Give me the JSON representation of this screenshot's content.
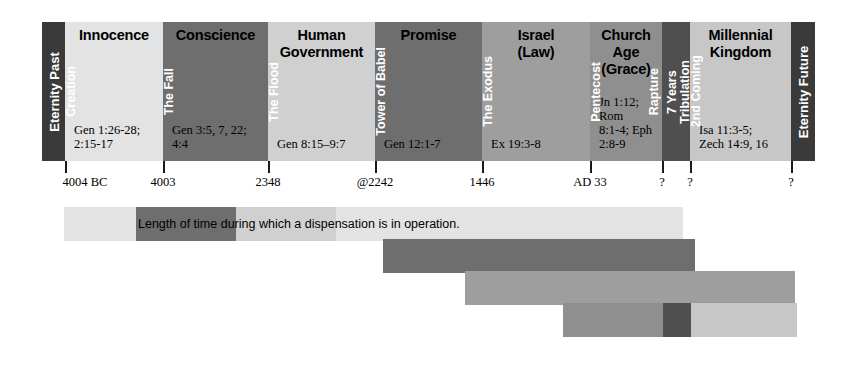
{
  "colors": {
    "eternity": "#3a3a3a",
    "very_light": "#e3e3e3",
    "light": "#d0d0d0",
    "mid_light": "#bdbdbd",
    "mid": "#9e9e9e",
    "dark": "#6e6e6e",
    "darker": "#4f4f4f",
    "tick": "#1a1a1a",
    "divider_text": "#ffffff",
    "body_text": "#000000"
  },
  "end_caps": [
    {
      "name": "eternity-past",
      "label": "Eternity Past",
      "x": 0,
      "w": 23,
      "color": "#3a3a3a"
    },
    {
      "name": "eternity-future",
      "label": "Eternity Future",
      "x": 749,
      "w": 24,
      "color": "#3a3a3a"
    }
  ],
  "dispensations": [
    {
      "name": "innocence",
      "title": "Innocence",
      "reference": "Gen 1:26-28;\n2:15-17",
      "ref_lines": [
        "Gen 1:26-28;",
        "2:15-17"
      ],
      "x": 23,
      "w": 98,
      "color": "#e3e3e3",
      "title_align": "center",
      "ref_align": "left"
    },
    {
      "name": "conscience",
      "title": "Conscience",
      "ref_lines": [
        "Gen 3:5, 7, 22;",
        "4:4"
      ],
      "x": 121,
      "w": 105,
      "color": "#6e6e6e",
      "title_align": "center",
      "ref_align": "left"
    },
    {
      "name": "human-government",
      "title": "Human\nGovernment",
      "title_lines": [
        "Human",
        "Government"
      ],
      "ref_lines": [
        "Gen 8:15–9:7"
      ],
      "x": 226,
      "w": 107,
      "color": "#d0d0d0",
      "title_align": "center",
      "ref_align": "left"
    },
    {
      "name": "promise",
      "title": "Promise",
      "ref_lines": [
        "Gen 12:1-7"
      ],
      "x": 333,
      "w": 107,
      "color": "#6e6e6e",
      "title_align": "center",
      "ref_align": "left"
    },
    {
      "name": "israel-law",
      "title": "Israel\n(Law)",
      "title_lines": [
        "Israel",
        "(Law)"
      ],
      "ref_lines": [
        "Ex 19:3-8"
      ],
      "x": 440,
      "w": 108,
      "color": "#9e9e9e",
      "title_align": "center",
      "ref_align": "left"
    },
    {
      "name": "church-age-grace",
      "title": "Church Age\n(Grace)",
      "title_lines": [
        "Church Age",
        "(Grace)"
      ],
      "ref_lines": [
        "Jn 1:12; Rom",
        "8:1-4; Eph 2:8-9"
      ],
      "x": 548,
      "w": 72,
      "color": "#8f8f8f",
      "title_align": "center",
      "ref_align": "left"
    },
    {
      "name": "tribulation",
      "title": "",
      "ref_lines": [],
      "x": 620,
      "w": 28,
      "color": "#4f4f4f",
      "title_align": "center",
      "ref_align": "center"
    },
    {
      "name": "millennial-kingdom",
      "title": "Millennial\nKingdom",
      "title_lines": [
        "Millennial",
        "Kingdom"
      ],
      "ref_lines": [
        "Isa 11:3-5;",
        "Zech 14:9, 16"
      ],
      "x": 648,
      "w": 101,
      "color": "#c7c7c7",
      "title_align": "center",
      "ref_align": "left"
    }
  ],
  "events": [
    {
      "name": "creation",
      "label": "Creation",
      "lines": [
        "Creation"
      ],
      "x": 23,
      "w": 13,
      "color": "#c9c9c9"
    },
    {
      "name": "the-fall",
      "label": "The Fall",
      "lines": [
        "The Fall"
      ],
      "x": 121,
      "w": 13,
      "color": "#6e6e6e"
    },
    {
      "name": "the-flood",
      "label": "The Flood",
      "lines": [
        "The Flood"
      ],
      "x": 226,
      "w": 13,
      "color": "#b9b9b9"
    },
    {
      "name": "tower-of-babel",
      "label": "Tower of Babel",
      "lines": [
        "Tower of Babel"
      ],
      "x": 333,
      "w": 15,
      "color": "#5f5f5f"
    },
    {
      "name": "the-exodus",
      "label": "The Exodus",
      "lines": [
        "The Exodus"
      ],
      "x": 440,
      "w": 14,
      "color": "#8c8c8c"
    },
    {
      "name": "pentecost",
      "label": "Pentecost",
      "lines": [
        "Pentecost"
      ],
      "x": 548,
      "w": 14,
      "color": "#7f7f7f"
    },
    {
      "name": "rapture",
      "label": "Rapture",
      "lines": [
        "Rapture"
      ],
      "x": 606,
      "w": 14,
      "color": "#7f7f7f"
    },
    {
      "name": "seven-years-tribulation",
      "label": "7 Years Tribulation",
      "lines": [
        "7 Years",
        "Tribulation"
      ],
      "x": 624,
      "w": 22,
      "color": "#4f4f4f"
    },
    {
      "name": "second-coming",
      "label": "2nd Coming",
      "lines": [
        "2nd Coming"
      ],
      "x": 648,
      "w": 14,
      "color": "#b0b0b0"
    }
  ],
  "axis": [
    {
      "name": "tick-4004bc",
      "label": "4004 BC",
      "x": 23,
      "label_offset": 20
    },
    {
      "name": "tick-4003",
      "label": "4003",
      "x": 121,
      "label_offset": 0
    },
    {
      "name": "tick-2348",
      "label": "2348",
      "x": 226,
      "label_offset": 0
    },
    {
      "name": "tick-2242",
      "label": "@2242",
      "x": 333,
      "label_offset": 0
    },
    {
      "name": "tick-1446",
      "label": "1446",
      "x": 440,
      "label_offset": 0
    },
    {
      "name": "tick-ad33",
      "label": "AD 33",
      "x": 548,
      "label_offset": 0
    },
    {
      "name": "tick-rapture",
      "label": "?",
      "x": 620,
      "label_offset": 0
    },
    {
      "name": "tick-2nd-coming",
      "label": "?",
      "x": 648,
      "label_offset": 0
    },
    {
      "name": "tick-eternity-future",
      "label": "?",
      "x": 749,
      "label_offset": 0
    }
  ],
  "duration_bars": {
    "caption": "Length of time during which a dispensation is in operation.",
    "rows": [
      {
        "name": "duration-row-1",
        "top": 207,
        "left": 64,
        "segments": [
          {
            "name": "dur-innocence",
            "w": 72,
            "color": "#e3e3e3"
          },
          {
            "name": "dur-conscience",
            "w": 100,
            "color": "#6e6e6e"
          },
          {
            "name": "dur-human-government",
            "w": 100,
            "color": "#d0d0d0"
          },
          {
            "name": "dur-promise-to-end",
            "w": 347,
            "color": "#e3e3e3"
          }
        ]
      },
      {
        "name": "duration-row-2",
        "top": 239,
        "left": 383,
        "segments": [
          {
            "name": "dur-promise-band",
            "w": 312,
            "color": "#6e6e6e"
          }
        ]
      },
      {
        "name": "duration-row-3",
        "top": 271,
        "left": 465,
        "segments": [
          {
            "name": "dur-israel-band",
            "w": 330,
            "color": "#9e9e9e"
          }
        ]
      },
      {
        "name": "duration-row-4",
        "top": 303,
        "left": 563,
        "segments": [
          {
            "name": "dur-church-age-band",
            "w": 100,
            "color": "#8f8f8f"
          },
          {
            "name": "dur-tribulation-band",
            "w": 28,
            "color": "#4f4f4f"
          },
          {
            "name": "dur-millennium-band",
            "w": 106,
            "color": "#c7c7c7"
          }
        ]
      }
    ]
  }
}
